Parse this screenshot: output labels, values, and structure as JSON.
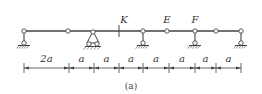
{
  "figure": {
    "caption": "(a)",
    "beam": {
      "x_start": 24,
      "x_end": 241,
      "y": 31,
      "color": "#444444"
    },
    "points": [
      {
        "id": "left-support",
        "x": 24,
        "type": "vertical-link-support"
      },
      {
        "id": "hinge-1",
        "x": 68,
        "type": "hinge"
      },
      {
        "id": "pin-support-triangle",
        "x": 93,
        "type": "fixed-hinge-support"
      },
      {
        "id": "K",
        "x": 119,
        "type": "section-mark",
        "label": "K"
      },
      {
        "id": "support-2",
        "x": 143,
        "type": "vertical-link-support"
      },
      {
        "id": "E",
        "x": 167,
        "type": "hinge",
        "label": "E"
      },
      {
        "id": "F",
        "x": 195,
        "type": "vertical-link-support",
        "label": "F"
      },
      {
        "id": "hinge-3",
        "x": 216,
        "type": "hinge"
      },
      {
        "id": "right-support",
        "x": 241,
        "type": "vertical-link-support"
      }
    ],
    "labels": {
      "K": "K",
      "E": "E",
      "F": "F"
    },
    "dimensions": {
      "y": 68,
      "ticks": [
        24,
        69,
        94,
        119,
        143,
        169,
        195,
        216,
        241
      ],
      "segments": [
        "2a",
        "a",
        "a",
        "a",
        "a",
        "a",
        "a",
        "a"
      ]
    }
  }
}
